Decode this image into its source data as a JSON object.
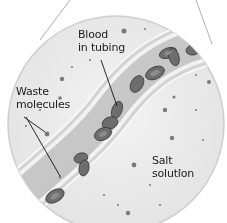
{
  "diagram": {
    "labels": {
      "blood": [
        "Blood",
        "in tubing"
      ],
      "waste": [
        "Waste",
        "molecules"
      ],
      "salt": [
        "Salt",
        "solution"
      ]
    },
    "colors": {
      "background": "#ffffff",
      "circle_fill": "#ececec",
      "circle_edge": "#c9c9c9",
      "tube_fill": "#d6d6d6",
      "tube_wall": "#f4f4f4",
      "cell": "#6e6e6e",
      "leader_line": "#111111"
    }
  }
}
